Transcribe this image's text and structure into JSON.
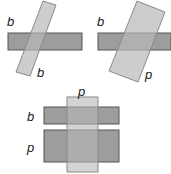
{
  "colors": {
    "bar_fill": "#8c8c8c",
    "bar_stroke": "#555555",
    "tilt_fill": "#c4c4c4",
    "tilt_stroke": "#8a8a8a",
    "label": "#1a1a1a",
    "background": "#ffffff"
  },
  "diagrams": [
    {
      "id": "top-left",
      "description": "Horizontal narrow bar crossed by tilted narrow bar",
      "labels": [
        {
          "text": "b",
          "x": 7,
          "y": 26
        },
        {
          "text": "b",
          "x": 37,
          "y": 77
        }
      ]
    },
    {
      "id": "top-right",
      "description": "Horizontal narrow bar crossed by tilted wide bar",
      "labels": [
        {
          "text": "b",
          "x": 97,
          "y": 26
        },
        {
          "text": "p",
          "x": 145,
          "y": 79
        }
      ]
    },
    {
      "id": "bottom",
      "description": "Vertical wide bar crossed by narrow and wide horizontal bars",
      "labels": [
        {
          "text": "p",
          "x": 78,
          "y": 96
        },
        {
          "text": "b",
          "x": 27,
          "y": 121
        },
        {
          "text": "p",
          "x": 27,
          "y": 152
        }
      ]
    }
  ],
  "labels": {
    "tl_top": "b",
    "tl_bottom": "b",
    "tr_top": "b",
    "tr_bottom": "p",
    "bot_top": "p",
    "bot_mid": "b",
    "bot_low": "p"
  }
}
